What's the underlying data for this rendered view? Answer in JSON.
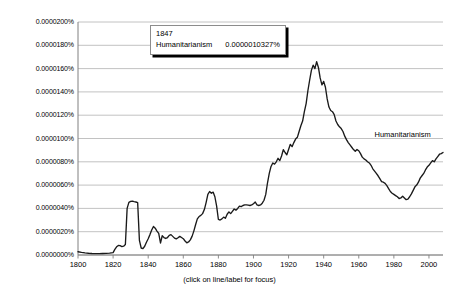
{
  "chart_data": {
    "type": "line",
    "title": "",
    "xlabel": "",
    "ylabel": "",
    "caption": "(click on line/label for focus)",
    "grid": true,
    "legend_position": "inline-right",
    "xlim": [
      1800,
      2008
    ],
    "ylim": [
      0,
      2e-05
    ],
    "x_ticks": [
      1800,
      1820,
      1840,
      1860,
      1880,
      1900,
      1920,
      1940,
      1960,
      1980,
      2000
    ],
    "x_tick_labels": [
      "1800",
      "1820",
      "1840",
      "1860",
      "1880",
      "1900",
      "1920",
      "1940",
      "1960",
      "1980",
      "2000"
    ],
    "y_ticks": [
      0,
      2e-06,
      4e-06,
      6e-06,
      8e-06,
      1e-05,
      1.2e-05,
      1.4e-05,
      1.6e-05,
      1.8e-05,
      2e-05
    ],
    "y_tick_labels": [
      "0.0000000%",
      "0.0000020%",
      "0.0000040%",
      "0.0000060%",
      "0.0000080%",
      "0.0000100%",
      "0.0000120%",
      "0.0000140%",
      "0.0000160%",
      "0.0000180%",
      "0.0000200%"
    ],
    "series": [
      {
        "name": "Humanitarianism",
        "color": "#1a1a1a",
        "label_x": 1985,
        "label_y": 1.03e-05,
        "x": [
          1800,
          1802,
          1804,
          1806,
          1808,
          1810,
          1812,
          1814,
          1816,
          1818,
          1820,
          1821,
          1822,
          1823,
          1824,
          1825,
          1826,
          1827,
          1828,
          1829,
          1830,
          1831,
          1832,
          1833,
          1834,
          1835,
          1836,
          1837,
          1838,
          1839,
          1840,
          1841,
          1842,
          1843,
          1844,
          1845,
          1846,
          1847,
          1848,
          1849,
          1850,
          1851,
          1852,
          1853,
          1854,
          1855,
          1856,
          1857,
          1858,
          1859,
          1860,
          1861,
          1862,
          1863,
          1864,
          1865,
          1866,
          1867,
          1868,
          1869,
          1870,
          1871,
          1872,
          1873,
          1874,
          1875,
          1876,
          1877,
          1878,
          1879,
          1880,
          1881,
          1882,
          1883,
          1884,
          1885,
          1886,
          1887,
          1888,
          1889,
          1890,
          1891,
          1892,
          1893,
          1894,
          1895,
          1896,
          1897,
          1898,
          1899,
          1900,
          1901,
          1902,
          1903,
          1904,
          1905,
          1906,
          1907,
          1908,
          1909,
          1910,
          1911,
          1912,
          1913,
          1914,
          1915,
          1916,
          1917,
          1918,
          1919,
          1920,
          1921,
          1922,
          1923,
          1924,
          1925,
          1926,
          1927,
          1928,
          1929,
          1930,
          1931,
          1932,
          1933,
          1934,
          1935,
          1936,
          1937,
          1938,
          1939,
          1940,
          1941,
          1942,
          1943,
          1944,
          1945,
          1946,
          1947,
          1948,
          1949,
          1950,
          1951,
          1952,
          1953,
          1954,
          1955,
          1956,
          1957,
          1958,
          1959,
          1960,
          1961,
          1962,
          1963,
          1964,
          1965,
          1966,
          1967,
          1968,
          1969,
          1970,
          1971,
          1972,
          1973,
          1974,
          1975,
          1976,
          1977,
          1978,
          1979,
          1980,
          1981,
          1982,
          1983,
          1984,
          1985,
          1986,
          1987,
          1988,
          1989,
          1990,
          1991,
          1992,
          1993,
          1994,
          1995,
          1996,
          1997,
          1998,
          1999,
          2000,
          2001,
          2002,
          2003,
          2004,
          2005,
          2006,
          2007,
          2008
        ],
        "y": [
          2.8e-07,
          2.2e-07,
          1.8e-07,
          1.5e-07,
          1.3e-07,
          1.2e-07,
          1.2e-07,
          1.3e-07,
          1.4e-07,
          1.6e-07,
          2e-07,
          4.8e-07,
          7e-07,
          8.2e-07,
          8e-07,
          7.2e-07,
          7.6e-07,
          9e-07,
          4e-06,
          4.52e-06,
          4.6e-06,
          4.62e-06,
          4.58e-06,
          4.55e-06,
          4.5e-06,
          1.25e-06,
          6e-07,
          5.5e-07,
          7.5e-07,
          1.1e-06,
          1.4e-06,
          1.75e-06,
          2.15e-06,
          2.45e-06,
          2.3e-06,
          2.05e-06,
          1.85e-06,
          1.03e-06,
          1.65e-06,
          1.5e-06,
          1.42e-06,
          1.5e-06,
          1.68e-06,
          1.75e-06,
          1.6e-06,
          1.45e-06,
          1.38e-06,
          1.48e-06,
          1.6e-06,
          1.5e-06,
          1.4e-06,
          1.2e-06,
          1.05e-06,
          1.12e-06,
          1.3e-06,
          1.6e-06,
          2.05e-06,
          2.6e-06,
          3.1e-06,
          3.3e-06,
          3.4e-06,
          3.55e-06,
          3.9e-06,
          4.5e-06,
          5.2e-06,
          5.45e-06,
          5.3e-06,
          5.4e-06,
          5e-06,
          4.2e-06,
          3.05e-06,
          3e-06,
          3.1e-06,
          3.25e-06,
          3.15e-06,
          3.5e-06,
          3.7e-06,
          3.55e-06,
          3.75e-06,
          3.95e-06,
          3.85e-06,
          4e-06,
          4.2e-06,
          4.15e-06,
          4.25e-06,
          4.3e-06,
          4.3e-06,
          4.28e-06,
          4.25e-06,
          4.3e-06,
          4.4e-06,
          4.55e-06,
          4.3e-06,
          4.25e-06,
          4.3e-06,
          4.45e-06,
          4.7e-06,
          5.2e-06,
          6.2e-06,
          7e-06,
          7.6e-06,
          7.9e-06,
          7.8e-06,
          8e-06,
          8.3e-06,
          8.1e-06,
          8.5e-06,
          9.05e-06,
          8.8e-06,
          8.6e-06,
          9.05e-06,
          9.5e-06,
          9.3e-06,
          9.65e-06,
          9.95e-06,
          1.01e-05,
          1.06e-05,
          1.11e-05,
          1.15e-05,
          1.23e-05,
          1.3e-05,
          1.41e-05,
          1.5e-05,
          1.585e-05,
          1.63e-05,
          1.6e-05,
          1.66e-05,
          1.61e-05,
          1.52e-05,
          1.46e-05,
          1.49e-05,
          1.44e-05,
          1.34e-05,
          1.27e-05,
          1.24e-05,
          1.23e-05,
          1.205e-05,
          1.15e-05,
          1.12e-05,
          1.1e-05,
          1.085e-05,
          1.06e-05,
          1.02e-05,
          9.9e-06,
          9.65e-06,
          9.45e-06,
          9.25e-06,
          9.05e-06,
          8.9e-06,
          9.05e-06,
          8.95e-06,
          8.7e-06,
          8.4e-06,
          8.25e-06,
          8.15e-06,
          8e-06,
          7.9e-06,
          7.7e-06,
          7.4e-06,
          7.2e-06,
          7e-06,
          6.8e-06,
          6.55e-06,
          6.3e-06,
          6.25e-06,
          6.15e-06,
          5.95e-06,
          5.7e-06,
          5.45e-06,
          5.3e-06,
          5.2e-06,
          5.1e-06,
          5e-06,
          4.85e-06,
          4.9e-06,
          5.05e-06,
          4.9e-06,
          4.75e-06,
          4.8e-06,
          5e-06,
          5.25e-06,
          5.55e-06,
          5.85e-06,
          6e-06,
          6.25e-06,
          6.6e-06,
          6.8e-06,
          7e-06,
          7.3e-06,
          7.55e-06,
          7.7e-06,
          7.9e-06,
          8.1e-06,
          8e-06,
          8.25e-06,
          8.45e-06,
          8.65e-06,
          8.7e-06,
          8.8e-06
        ]
      }
    ]
  },
  "tooltip": {
    "year": "1847",
    "series_name": "Humanitarianism",
    "value": "0.0000010327%"
  },
  "series_label": {
    "text": "Humanitarianism"
  },
  "colors": {
    "line": "#1a1a1a",
    "grid": "#b3b3b3",
    "axis": "#808080",
    "text": "#000000",
    "background": "#ffffff"
  }
}
